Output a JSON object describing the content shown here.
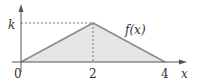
{
  "chart_data": {
    "type": "area",
    "title": "",
    "function_label": "f(x)",
    "xlabel": "x",
    "ylabel": "",
    "points": [
      {
        "x": 0,
        "y": 0
      },
      {
        "x": 2,
        "y": 1
      },
      {
        "x": 4,
        "y": 0
      }
    ],
    "y_scale_note": "peak value is k",
    "x_ticks": [
      "0",
      "2",
      "4"
    ],
    "y_ticks": [
      "k"
    ],
    "xlim": [
      0,
      4
    ],
    "ylim": [
      0,
      1
    ],
    "grid": false,
    "reference_lines": [
      "dashed horizontal at y=k",
      "dashed vertical at x=2"
    ],
    "colors": {
      "fill": "#e6e6e6",
      "line": "#8c8c8c",
      "axis": "#555555",
      "dash": "#555555"
    }
  }
}
